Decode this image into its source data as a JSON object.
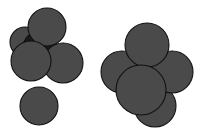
{
  "figure": {
    "width": 207,
    "height": 137,
    "background_color": "#ffffff",
    "caption": ""
  },
  "palette": {
    "sphere_fill": "#4a4a4a",
    "sphere_fill_light": "#9a9a9a",
    "sphere_fill_dark": "#1a1a1a",
    "outline": "#111111",
    "background": "#ffffff"
  },
  "clusters": [
    {
      "id": "left-cluster",
      "name": "left-sphere-cluster",
      "label": "",
      "sphere_count": 5,
      "spheres": [
        {
          "id": "left-sphere-top",
          "name": "sphere-top",
          "cx": 47,
          "cy": 27,
          "r": 19,
          "fill": "#4a4a4a",
          "z": 4
        },
        {
          "id": "left-sphere-upperleft",
          "name": "sphere-upper-left",
          "cx": 25,
          "cy": 42,
          "r": 15,
          "fill": "#4a4a4a",
          "z": 2
        },
        {
          "id": "left-sphere-shadow",
          "name": "sphere-occluded-dark",
          "cx": 40,
          "cy": 48,
          "r": 17,
          "fill": "#1a1a1a",
          "z": 3
        },
        {
          "id": "left-sphere-lowerleft",
          "name": "sphere-lower-left",
          "cx": 31,
          "cy": 61,
          "r": 20,
          "fill": "#4a4a4a",
          "z": 6
        },
        {
          "id": "left-sphere-right",
          "name": "sphere-right",
          "cx": 63,
          "cy": 63,
          "r": 20,
          "fill": "#4a4a4a",
          "z": 5
        },
        {
          "id": "left-sphere-isolated",
          "name": "sphere-isolated-bottom",
          "cx": 39,
          "cy": 106,
          "r": 19,
          "fill": "#4a4a4a",
          "z": 1
        }
      ]
    },
    {
      "id": "right-cluster",
      "name": "right-sphere-cluster",
      "label": "",
      "sphere_count": 6,
      "spheres": [
        {
          "id": "right-sphere-center-light",
          "name": "sphere-central-light",
          "cx": 150,
          "cy": 70,
          "r": 20,
          "fill": "#9a9a9a",
          "z": 1
        },
        {
          "id": "right-sphere-top",
          "name": "sphere-top",
          "cx": 147,
          "cy": 45,
          "r": 22,
          "fill": "#4a4a4a",
          "z": 4
        },
        {
          "id": "right-sphere-left",
          "name": "sphere-left",
          "cx": 122,
          "cy": 72,
          "r": 21,
          "fill": "#4a4a4a",
          "z": 3
        },
        {
          "id": "right-sphere-right",
          "name": "sphere-right",
          "cx": 172,
          "cy": 72,
          "r": 21,
          "fill": "#4a4a4a",
          "z": 3
        },
        {
          "id": "right-sphere-bottom",
          "name": "sphere-bottom",
          "cx": 155,
          "cy": 106,
          "r": 21,
          "fill": "#4a4a4a",
          "z": 2
        },
        {
          "id": "right-sphere-front",
          "name": "sphere-front",
          "cx": 141,
          "cy": 90,
          "r": 25,
          "fill": "#4a4a4a",
          "z": 6
        }
      ]
    }
  ]
}
